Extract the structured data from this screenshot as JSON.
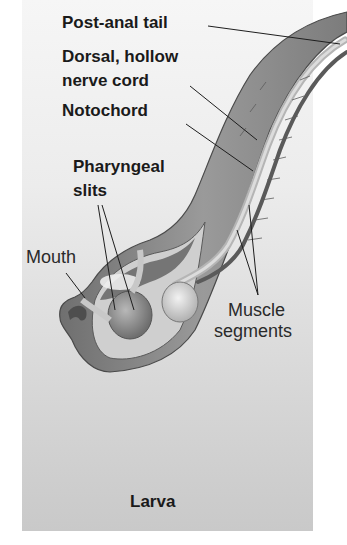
{
  "figure": {
    "caption": "Larva",
    "background_gradient": [
      "#f6f6f6",
      "#c9c9c9"
    ],
    "body_color": "#8a8a8a",
    "labels": {
      "post_anal_tail": "Post-anal tail",
      "dorsal_nerve_cord_line1": "Dorsal, hollow",
      "dorsal_nerve_cord_line2": "nerve cord",
      "notochord": "Notochord",
      "pharyngeal_slits_line1": "Pharyngeal",
      "pharyngeal_slits_line2": "slits",
      "mouth": "Mouth",
      "muscle_segments_line1": "Muscle",
      "muscle_segments_line2": "segments"
    }
  }
}
